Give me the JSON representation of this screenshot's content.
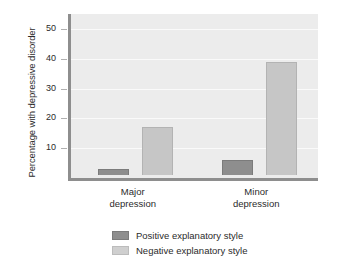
{
  "chart_data": {
    "type": "bar",
    "title": "",
    "xlabel": "",
    "ylabel": "Percentage with depressive disorder",
    "categories": [
      "Major\ndepression",
      "Minor\ndepression"
    ],
    "category_lines": [
      {
        "line1": "Major",
        "line2": "depression"
      },
      {
        "line1": "Minor",
        "line2": "depression"
      }
    ],
    "series": [
      {
        "name": "Positive explanatory style",
        "color": "#8e8e8e",
        "values": [
          2,
          5
        ]
      },
      {
        "name": "Negative explanatory style",
        "color": "#c6c6c6",
        "values": [
          16,
          38
        ]
      }
    ],
    "ylim": [
      0,
      55
    ],
    "yticks": [
      10,
      20,
      30,
      40,
      50
    ],
    "ytick_labels": [
      "10",
      "20",
      "30",
      "40",
      "50"
    ],
    "grid": true,
    "legend_position": "bottom-center",
    "plot_background": "#ececec",
    "axis_color": "#8e8e8e",
    "gridline_color": "#fafafa"
  },
  "legend": {
    "entries": [
      {
        "label": "Positive explanatory style"
      },
      {
        "label": "Negative explanatory style"
      }
    ]
  }
}
